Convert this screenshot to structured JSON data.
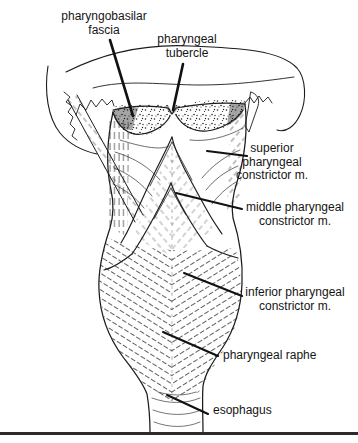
{
  "labels": {
    "pharyngobasilar_fascia": {
      "lines": [
        "pharyngobasilar",
        "fascia"
      ]
    },
    "pharyngeal_tubercle": {
      "lines": [
        "pharyngeal",
        "tubercle"
      ]
    },
    "superior_constrictor": {
      "lines": [
        "superior",
        "pharyngeal",
        "constrictor m."
      ]
    },
    "middle_constrictor": {
      "lines": [
        "middle pharyngeal",
        "constrictor m."
      ]
    },
    "inferior_constrictor": {
      "lines": [
        "inferior pharyngeal",
        "constrictor m."
      ]
    },
    "pharyngeal_raphe": {
      "lines": [
        "pharyngeal raphe"
      ]
    },
    "esophagus": {
      "lines": [
        "esophagus"
      ]
    }
  },
  "colors": {
    "ink": "#1c1c1c",
    "background": "#ffffff",
    "rule": "#2b2b2b"
  }
}
